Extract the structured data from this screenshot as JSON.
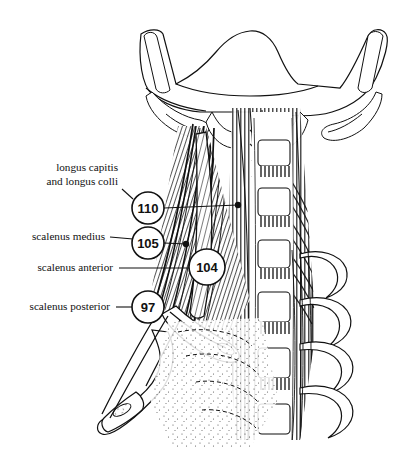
{
  "figure": {
    "background_color": "#ffffff",
    "ink_color": "#111111",
    "width": 407,
    "height": 454
  },
  "labels": [
    {
      "id": "longus",
      "name": "longus-capitis-and-longus-colli",
      "lines": [
        "longus capitis",
        "and longus colli"
      ],
      "number": "110",
      "text_x": 118,
      "line1_y": 171,
      "line2_y": 185,
      "circle": {
        "cx": 148,
        "cy": 208,
        "r": 16
      },
      "leader_from": {
        "x": 122,
        "y": 189
      },
      "leader_to": {
        "x": 133,
        "y": 199
      },
      "pointer_to": {
        "x": 238,
        "y": 205
      },
      "has_endpoint_dot": true
    },
    {
      "id": "medius",
      "name": "scalenus-medius",
      "lines": [
        "scalenus medius"
      ],
      "number": "105",
      "text_x": 105,
      "line1_y": 240,
      "circle": {
        "cx": 148,
        "cy": 243,
        "r": 16
      },
      "leader_from": {
        "x": 110,
        "y": 237
      },
      "leader_to": {
        "x": 133,
        "y": 238
      },
      "pointer_to": {
        "x": 186,
        "y": 244
      },
      "has_endpoint_dot": true
    },
    {
      "id": "anterior",
      "name": "scalenus-anterior",
      "lines": [
        "scalenus anterior"
      ],
      "number": "104",
      "text_x": 113,
      "line1_y": 271,
      "circle": {
        "cx": 207,
        "cy": 267,
        "r": 18
      },
      "leader_from": {
        "x": 119,
        "y": 268
      },
      "leader_to": {
        "x": 189,
        "y": 268
      },
      "has_endpoint_dot": false
    },
    {
      "id": "posterior",
      "name": "scalenus-posterior",
      "lines": [
        "scalenus posterior"
      ],
      "number": "97",
      "text_x": 110,
      "line1_y": 310,
      "circle": {
        "cx": 148,
        "cy": 307,
        "r": 16
      },
      "leader_from": {
        "x": 116,
        "y": 307
      },
      "leader_to": {
        "x": 132,
        "y": 307
      },
      "has_endpoint_dot": false
    }
  ],
  "anatomy": {
    "regions": [
      {
        "name": "occipital-bone-base",
        "description": "stippled skull base spanning the top"
      },
      {
        "name": "mastoid-process-left",
        "description": "left styloid and mastoid process"
      },
      {
        "name": "mastoid-process-right",
        "description": "right styloid and mastoid process"
      },
      {
        "name": "cervical-vertebral-bodies",
        "description": "stack of cervical vertebral bodies with disc spaces"
      },
      {
        "name": "scalene-muscle-group",
        "description": "diagonal hatched scalene muscles on the left"
      },
      {
        "name": "longus-muscle-group",
        "description": "longitudinal prevertebral muscles beside the spine"
      },
      {
        "name": "rib-first-left",
        "description": "first rib with scalene insertion tubercle"
      },
      {
        "name": "rib-second-left",
        "description": "second rib with scalene posterior insertion"
      },
      {
        "name": "ribs-right",
        "description": "four curving right-side ribs"
      },
      {
        "name": "thoracic-inlet-shading",
        "description": "stippled shading of the thoracic inlet"
      }
    ],
    "vertebra_count": 6,
    "right_rib_count": 4
  }
}
